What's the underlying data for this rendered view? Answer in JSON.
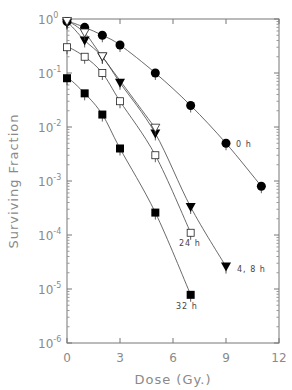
{
  "chart_data": {
    "type": "scatter",
    "title": "",
    "xlabel": "Dose (Gy.)",
    "ylabel": "Surviving Fraction",
    "xlim": [
      0,
      12
    ],
    "ylim": [
      1e-06,
      1
    ],
    "yscale": "log",
    "grid": false,
    "x_ticks": [
      "0",
      "3",
      "6",
      "9",
      "12"
    ],
    "y_ticks": [
      {
        "base": "10",
        "exp": "0"
      },
      {
        "base": "10",
        "exp": "-1"
      },
      {
        "base": "10",
        "exp": "-2"
      },
      {
        "base": "10",
        "exp": "-3"
      },
      {
        "base": "10",
        "exp": "-4"
      },
      {
        "base": "10",
        "exp": "-5"
      },
      {
        "base": "10",
        "exp": "-6"
      }
    ],
    "series": [
      {
        "name": "0 h",
        "marker": "filled-circle",
        "label": "0 h",
        "x": [
          0,
          1,
          2,
          3,
          5,
          7,
          9,
          11
        ],
        "y": [
          0.9,
          0.7,
          0.5,
          0.33,
          0.1,
          0.025,
          0.005,
          0.0008
        ]
      },
      {
        "name": "4 h",
        "marker": "filled-triangle-down",
        "label": "4, 8 h",
        "x": [
          0,
          1,
          2,
          3,
          5,
          7,
          9
        ],
        "y": [
          0.85,
          0.4,
          0.2,
          0.066,
          0.0076,
          0.00033,
          2.6e-05
        ]
      },
      {
        "name": "8 h",
        "marker": "open-triangle-down",
        "label": "",
        "x": [
          0,
          1,
          2,
          5
        ],
        "y": [
          0.9,
          0.55,
          0.2,
          0.0095
        ]
      },
      {
        "name": "24 h",
        "marker": "open-square",
        "label": "24 h",
        "x": [
          0,
          1,
          2,
          3,
          5,
          7
        ],
        "y": [
          0.3,
          0.2,
          0.1,
          0.03,
          0.003,
          0.00011
        ]
      },
      {
        "name": "32 h",
        "marker": "filled-square",
        "label": "32 h",
        "x": [
          0,
          1,
          2,
          3,
          5,
          7
        ],
        "y": [
          0.08,
          0.042,
          0.017,
          0.004,
          0.00026,
          7.8e-06
        ]
      }
    ],
    "legend": "inline labels at curve ends"
  },
  "labels": {
    "xlabel": "Dose (Gy.)",
    "ylabel": "Surviving Fraction",
    "curve_0h": "0 h",
    "curve_48h": "4, 8 h",
    "curve_24h": "24 h",
    "curve_32h": "32 h"
  }
}
